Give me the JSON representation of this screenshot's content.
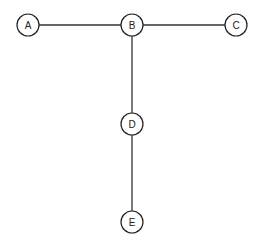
{
  "diagram": {
    "type": "tree",
    "nodes": [
      {
        "id": "A",
        "label": "A",
        "x": 28,
        "y": 25
      },
      {
        "id": "B",
        "label": "B",
        "x": 132,
        "y": 25
      },
      {
        "id": "C",
        "label": "C",
        "x": 236,
        "y": 25
      },
      {
        "id": "D",
        "label": "D",
        "x": 132,
        "y": 124
      },
      {
        "id": "E",
        "label": "E",
        "x": 132,
        "y": 222
      }
    ],
    "edges": [
      {
        "from": "A",
        "to": "B"
      },
      {
        "from": "B",
        "to": "C"
      },
      {
        "from": "B",
        "to": "D"
      },
      {
        "from": "D",
        "to": "E"
      }
    ],
    "node_radius": 11
  }
}
